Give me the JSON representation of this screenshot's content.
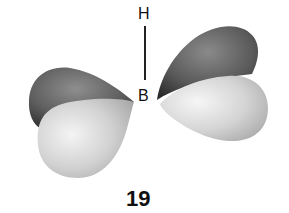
{
  "diagram": {
    "type": "orbital-diagram",
    "atoms": {
      "top": "H",
      "center": "B"
    },
    "bond": {
      "from": "H",
      "to": "B",
      "style": "single-line"
    },
    "figure_number": "19",
    "lobes": [
      {
        "name": "left-back-lobe",
        "phase": "dark"
      },
      {
        "name": "left-front-lobe",
        "phase": "light"
      },
      {
        "name": "right-back-lobe",
        "phase": "dark"
      },
      {
        "name": "right-front-lobe",
        "phase": "light"
      }
    ],
    "colors": {
      "dark_lobe": "#4a4a4a",
      "dark_lobe_highlight": "#8a8a8a",
      "light_lobe": "#c8c8c8",
      "light_lobe_highlight": "#f2f2f2",
      "text": "#111111"
    }
  }
}
